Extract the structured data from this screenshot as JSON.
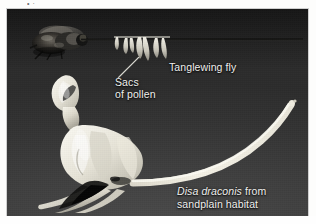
{
  "figure": {
    "type": "photograph",
    "clipped_top_text": "• ·",
    "background_color": "#3a3a3a",
    "label_color": "#f2f2f0",
    "page_color": "#fdfdfc"
  },
  "labels": {
    "fly": "Tanglewing fly",
    "pollen_sacs_line1": "Sacs",
    "pollen_sacs_line2": "of pollen",
    "species_name": "Disa draconis",
    "species_suffix": " from",
    "habitat_line": "sandplain habitat"
  },
  "elements": {
    "fly_name": "tanglewing-fly",
    "proboscis_name": "fly-proboscis",
    "pollinia_name": "pollen-sacs",
    "orchid_name": "disa-draconis-flower",
    "spur_name": "nectar-spur",
    "leader_name": "pollen-sacs-leader-line"
  }
}
